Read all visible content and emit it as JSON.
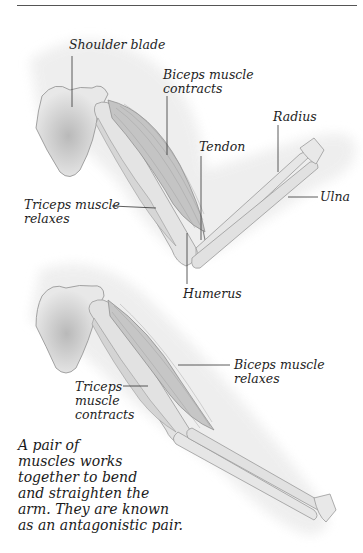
{
  "diagram": {
    "top_figure": {
      "state": "arm bent",
      "labels": {
        "shoulder_blade": "Shoulder blade",
        "biceps_line1": "Biceps muscle",
        "biceps_line2": "contracts",
        "tendon": "Tendon",
        "radius": "Radius",
        "ulna": "Ulna",
        "triceps_line1": "Triceps muscle",
        "triceps_line2": "relaxes",
        "humerus": "Humerus"
      }
    },
    "bottom_figure": {
      "state": "arm straightened",
      "labels": {
        "biceps_line1": "Biceps muscle",
        "biceps_line2": "relaxes",
        "triceps_line1": "Triceps",
        "triceps_line2": "muscle",
        "triceps_line3": "contracts"
      }
    },
    "caption": {
      "lines": [
        "A pair of",
        "muscles works",
        "together to bend",
        "and straighten the",
        "arm. They are known",
        "as an antagonistic pair."
      ]
    },
    "colors": {
      "skin_shadow": "#ececec",
      "bone": "#e6e6e6",
      "bone_outline": "#9a9a9a",
      "muscle": "#bdbdbd",
      "leader_line": "#333333",
      "text": "#1e1e1e"
    }
  }
}
